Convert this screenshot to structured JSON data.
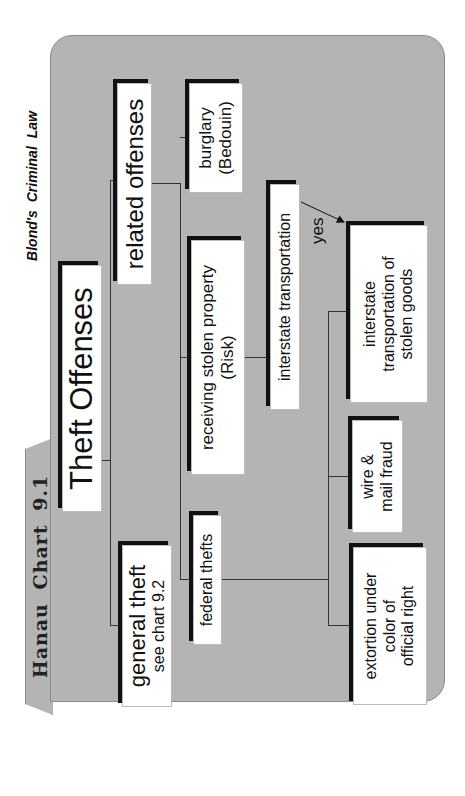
{
  "header": {
    "tab_label": "Hanau Chart 9.1",
    "source_label": "Blond's Criminal Law"
  },
  "diagram": {
    "root": {
      "label": "Theft Offenses"
    },
    "general_theft": {
      "label": "general theft",
      "sublabel": "see chart 9.2"
    },
    "related_offenses": {
      "label": "related offenses"
    },
    "federal_thefts": {
      "label": "federal thefts"
    },
    "receiving_stolen_property": {
      "line1": "receiving stolen property",
      "line2": "(Risk)"
    },
    "burglary": {
      "line1": "burglary",
      "line2": "(Bedouin)"
    },
    "interstate_transportation": {
      "label": "interstate transportation"
    },
    "arrow_label": "yes",
    "extortion": {
      "line1": "extortion under",
      "line2": "color of",
      "line3": "official right"
    },
    "wire_mail_fraud": {
      "line1": "wire &",
      "line2": "mail fraud"
    },
    "interstate_stolen_goods": {
      "line1": "interstate",
      "line2": "transportation of",
      "line3": "stolen goods"
    }
  },
  "colors": {
    "panel": "#b4b4b4",
    "box": "#ffffff",
    "shadow": "#111111",
    "line": "#333333"
  }
}
